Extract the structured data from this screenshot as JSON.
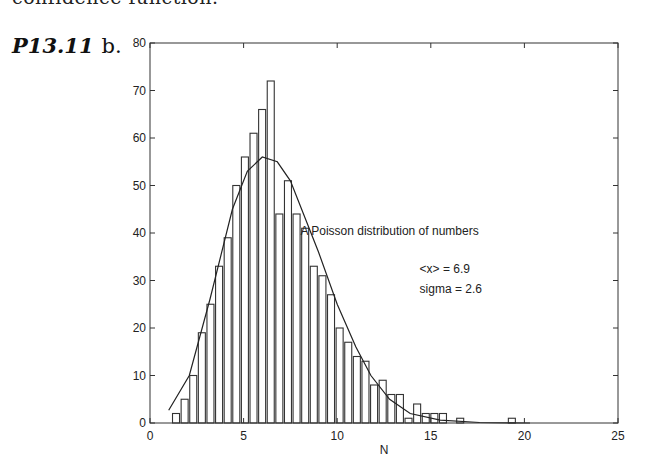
{
  "page": {
    "cut_text": "confidence function.",
    "problem_number": "P13.11",
    "problem_part": "b."
  },
  "chart_data": {
    "type": "bar",
    "title": "",
    "xlabel": "N",
    "ylabel": "",
    "xlim": [
      0,
      25
    ],
    "ylim": [
      0,
      80
    ],
    "xticks": [
      0,
      5,
      10,
      15,
      20,
      25
    ],
    "yticks": [
      0,
      10,
      20,
      30,
      40,
      50,
      60,
      70,
      80
    ],
    "grid": false,
    "bin_width": 0.46,
    "bin_centers": [
      1.39,
      1.85,
      2.31,
      2.77,
      3.23,
      3.69,
      4.15,
      4.61,
      5.07,
      5.53,
      5.99,
      6.45,
      6.91,
      7.37,
      7.83,
      8.29,
      8.75,
      9.21,
      9.67,
      10.13,
      10.59,
      11.05,
      11.51,
      11.97,
      12.43,
      12.89,
      13.35,
      13.81,
      14.27,
      14.73,
      15.19,
      15.65,
      16.11,
      16.57,
      17.03,
      17.49,
      17.95,
      18.41,
      18.87,
      19.33
    ],
    "values": [
      2,
      5,
      10,
      19,
      25,
      33,
      39,
      50,
      56,
      61,
      66,
      72,
      44,
      51,
      44,
      41,
      33,
      31,
      27,
      20,
      17,
      14,
      13,
      8,
      9,
      6,
      6,
      1,
      4,
      2,
      2,
      2,
      0,
      1,
      0,
      0,
      0,
      0,
      0,
      1
    ],
    "series": [
      {
        "name": "histogram",
        "type": "bar"
      },
      {
        "name": "fit",
        "type": "line",
        "x": [
          1.0,
          2.1,
          3.2,
          4.4,
          5.2,
          6.0,
          6.8,
          7.5,
          9.0,
          10.0,
          11.0,
          11.8,
          12.8,
          13.9,
          15.5,
          17.6,
          20.3
        ],
        "y": [
          2.7,
          10,
          26,
          45,
          53,
          56,
          55,
          51,
          36,
          25,
          16,
          10,
          5,
          2,
          0.6,
          0.1,
          0
        ]
      }
    ],
    "annotations": [
      {
        "text": "A Poisson distribution of numbers",
        "x": 12.8,
        "y": 39.5
      },
      {
        "text": "<x> = 6.9",
        "x": 14.4,
        "y": 31.5
      },
      {
        "text": "sigma = 2.6",
        "x": 14.4,
        "y": 27.3
      }
    ],
    "legend": null
  }
}
